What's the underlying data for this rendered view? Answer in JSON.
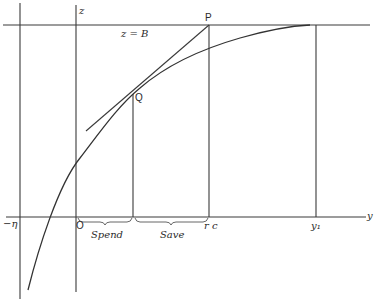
{
  "diagram": {
    "type": "economic-geometry",
    "labels": {
      "z_axis": "z",
      "y_axis": "y",
      "budget_line": "z = B",
      "point_p": "P",
      "point_q": "Q",
      "origin": "O",
      "neg_eta": "−η",
      "rc": "r c",
      "y1": "y₁",
      "spend": "Spend",
      "save": "Save"
    },
    "elements": {
      "curve": "concave utility curve rising from below y-axis, asymptotic to z = B at y₁",
      "tangent": "tangent line through Q reaching P on z = B",
      "verticals": [
        "−η",
        "O (z-axis)",
        "Q foot",
        "P / rc",
        "y₁"
      ],
      "braces": [
        "Spend: O to Q foot",
        "Save: Q foot to rc"
      ]
    },
    "colors": {
      "ink": "#333333",
      "background": "#ffffff"
    }
  }
}
